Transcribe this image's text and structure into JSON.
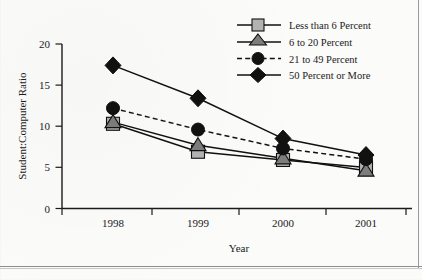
{
  "chart_data": {
    "type": "line",
    "title": "",
    "xlabel": "Year",
    "ylabel": "Student:Computer Ratio",
    "categories": [
      "1998",
      "1999",
      "2000",
      "2001"
    ],
    "x_tick_labels": [
      "1998",
      "1999",
      "2000",
      "2001"
    ],
    "y_tick_labels": [
      "0",
      "5",
      "10",
      "15",
      "20"
    ],
    "y_ticks": [
      0,
      5,
      10,
      15,
      20
    ],
    "ylim": [
      0,
      20
    ],
    "grid": false,
    "legend_position": "top-right",
    "series": [
      {
        "name": "Less than 6 Percent",
        "marker": "square",
        "line_style": "solid",
        "marker_color": "#b3b3b3",
        "line_color": "#111111",
        "values": [
          10.3,
          6.9,
          5.9,
          5.0
        ]
      },
      {
        "name": "6 to 20 Percent",
        "marker": "triangle",
        "line_style": "solid",
        "marker_color": "#7d7d7d",
        "line_color": "#111111",
        "values": [
          10.5,
          7.7,
          6.1,
          4.6
        ]
      },
      {
        "name": "21 to 49 Percent",
        "marker": "circle",
        "line_style": "dashed",
        "marker_color": "#111111",
        "line_color": "#111111",
        "values": [
          12.2,
          9.6,
          7.3,
          6.0
        ]
      },
      {
        "name": "50 Percent or More",
        "marker": "diamond",
        "line_style": "solid",
        "marker_color": "#111111",
        "line_color": "#111111",
        "values": [
          17.4,
          13.4,
          8.5,
          6.5
        ]
      }
    ]
  },
  "legend": {
    "items": [
      {
        "label": "Less than 6 Percent"
      },
      {
        "label": "6 to 20 Percent"
      },
      {
        "label": "21 to 49 Percent"
      },
      {
        "label": "50 Percent or More"
      }
    ]
  },
  "axes": {
    "y_title": "Student:Computer Ratio",
    "x_title": "Year"
  }
}
